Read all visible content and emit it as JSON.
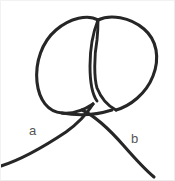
{
  "figure": {
    "name": "knot-diagram",
    "background_color": "#ffffff",
    "border_color": "#f0f0f0",
    "stroke_color": "#262626",
    "stroke_width": 3,
    "width": 175,
    "height": 181
  },
  "labels": {
    "left_end": "a",
    "right_end": "b"
  },
  "chart_data": {
    "type": "line",
    "title": "",
    "xlabel": "",
    "ylabel": "",
    "grid": false,
    "legend": "none",
    "xlim": [
      0,
      175
    ],
    "ylim": [
      0,
      181
    ],
    "annotations": [
      {
        "text": "a",
        "x": 34,
        "y": 130
      },
      {
        "text": "b",
        "x": 135,
        "y": 139
      }
    ],
    "series": [
      {
        "name": "strand-a-tail-to-left-loop",
        "path": "M 1 166 C 20 160 45 146 66 132 C 80 122 88 112 93 104"
      },
      {
        "name": "left-loop",
        "path": "M 93 104 C 84 110 72 114 62 113 C 48 112 39 100 37 82 C 35 62 42 42 56 30 C 70 18 88 14 98 20"
      },
      {
        "name": "lens-left-strand",
        "path": "M 98 20 C 94 30 90 48 90 66 C 90 82 92 94 97 101"
      },
      {
        "name": "right-loop",
        "path": "M 98 20 C 110 14 130 17 144 29 C 157 40 160 58 153 76 C 146 94 130 106 116 110"
      },
      {
        "name": "lens-right-strand-to-crossing",
        "path": "M 116 110 C 108 106 101 98 97 88 C 94 78 94 56 97 40 C 98 30 98 24 98 20"
      },
      {
        "name": "strand-b-tail",
        "path": "M 82 110 C 95 116 110 130 124 146 C 138 162 148 172 154 177"
      }
    ]
  }
}
